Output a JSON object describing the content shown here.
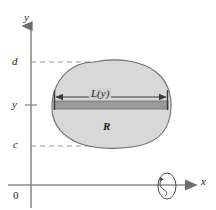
{
  "figure": {
    "type": "math-diagram",
    "axes": {
      "y_axis_label": "y",
      "x_axis_label": "x",
      "origin_label": "0"
    },
    "tick_labels": {
      "upper_bound": "d",
      "variable": "y",
      "lower_bound": "c"
    },
    "annotations": {
      "region_label": "R",
      "strip_length_label": "L(y)"
    },
    "icons": {
      "y_axis_arrow": "arrowhead-up-icon",
      "x_axis_arrow": "arrowhead-right-icon",
      "rotation_symbol": "rotation-about-x-axis-icon",
      "strip_arrow_left": "arrowhead-left-icon",
      "strip_arrow_right": "arrowhead-right-icon"
    },
    "colors": {
      "region_fill": "#d8d8d8",
      "region_stroke": "#6e6e6e",
      "strip_fill": "#9a9a9a",
      "axis": "#8c8c8c",
      "dashed_guide": "#9a9a9a",
      "text": "#1b1b1b",
      "background": "#ffffff"
    },
    "geometry": {
      "y_axis_x": 31,
      "x_axis_y": 185,
      "line_d_y": 62,
      "line_y_y": 105,
      "line_c_y": 146,
      "strip_left_x": 54,
      "strip_right_x": 168,
      "rotation_symbol_center": [
        167,
        186
      ]
    }
  }
}
